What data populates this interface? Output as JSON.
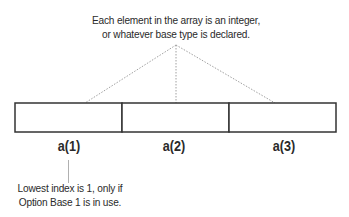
{
  "diagram": {
    "title_annotation": {
      "line1": "Each element in the array is an integer,",
      "line2": "or whatever base type is declared."
    },
    "array": {
      "cells": [
        {
          "label": "a(1)"
        },
        {
          "label": "a(2)"
        },
        {
          "label": "a(3)"
        }
      ]
    },
    "bottom_annotation": {
      "line1": "Lowest index is 1, only if",
      "line2": "Option Base 1 is in use."
    },
    "colors": {
      "stroke": "#333333",
      "connector": "#9a9a9a",
      "text": "#2a2a2a"
    }
  }
}
